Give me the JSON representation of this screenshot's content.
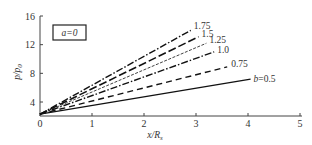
{
  "chart_data": {
    "type": "line",
    "title": "",
    "xlabel": "x/R_s",
    "ylabel": "p/p_0",
    "xlim": [
      0,
      5
    ],
    "ylim": [
      0,
      16
    ],
    "x_ticks": [
      "0",
      "1",
      "2",
      "3",
      "4",
      "5"
    ],
    "y_ticks": [
      "4",
      "8",
      "12",
      "16"
    ],
    "legend_box": "a=0",
    "grid": false,
    "series": [
      {
        "name": "1.75",
        "style": "dash-dot",
        "x": [
          0,
          2.9
        ],
        "y": [
          2.3,
          14.0
        ]
      },
      {
        "name": "1.5",
        "style": "long-dash",
        "x": [
          0,
          3.05
        ],
        "y": [
          2.3,
          13.1
        ]
      },
      {
        "name": "1.25",
        "style": "fine-dash",
        "x": [
          0,
          3.2
        ],
        "y": [
          2.3,
          12.2
        ]
      },
      {
        "name": "1.0",
        "style": "dash-dot",
        "x": [
          0,
          3.35
        ],
        "y": [
          2.3,
          11.0
        ]
      },
      {
        "name": "0.75",
        "style": "dash",
        "x": [
          0,
          3.6
        ],
        "y": [
          2.3,
          8.9
        ]
      },
      {
        "name": "b=0.5",
        "style": "solid",
        "x": [
          0,
          4.05
        ],
        "y": [
          2.3,
          7.2
        ]
      }
    ]
  }
}
